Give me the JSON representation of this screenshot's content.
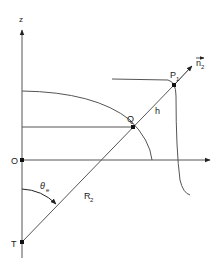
{
  "diagram": {
    "labels": {
      "z_axis": "z",
      "origin": "O",
      "point_T": "T",
      "point_Q": "Q",
      "point_P": "P",
      "point_P_sub": "1",
      "normal_vector": "n",
      "normal_vector_sub": "2",
      "height": "h",
      "radius": "R",
      "radius_sub": "2",
      "angle": "θ",
      "angle_sub": "e"
    },
    "colors": {
      "line": "#555555",
      "point": "#111111",
      "text": "#222222",
      "background": "#ffffff"
    }
  }
}
